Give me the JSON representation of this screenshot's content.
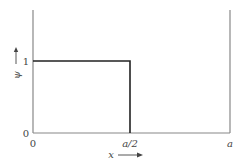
{
  "diagram": {
    "type": "step-function plot",
    "y_axis": {
      "symbol": "ψ",
      "arrow": "↑",
      "ticks": [
        "1",
        "0"
      ]
    },
    "x_axis": {
      "symbol": "x",
      "arrow": "→",
      "ticks": [
        "0",
        "a/2",
        "a"
      ]
    },
    "function": {
      "description": "ψ = 1 for 0 ≤ x < a/2, ψ = 0 for a/2 < x ≤ a",
      "points": [
        [
          0,
          1
        ],
        [
          0.5,
          1
        ],
        [
          0.5,
          0
        ],
        [
          1,
          0
        ]
      ]
    },
    "colors": {
      "axis": "#888888",
      "curve": "#222222",
      "text": "#444444"
    }
  }
}
